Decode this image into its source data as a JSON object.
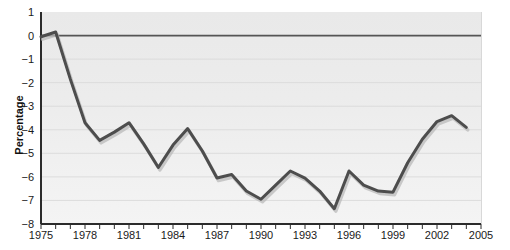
{
  "chart_data": {
    "type": "line",
    "title": "",
    "xlabel": "",
    "ylabel": "Percentage",
    "xlim": [
      1975,
      2005
    ],
    "ylim": [
      -8,
      1
    ],
    "grid": true,
    "legend": "none",
    "zero_line": 0,
    "series_color": "#4d4d4d",
    "plot_background": "#ececec",
    "gridline_color": "#dcdcdc",
    "y_ticks": [
      1,
      0,
      -1,
      -2,
      -3,
      -4,
      -5,
      -6,
      -7,
      -8
    ],
    "y_tick_labels": [
      "1",
      "0",
      "−1",
      "−2",
      "−3",
      "−4",
      "−5",
      "−6",
      "−7",
      "−8"
    ],
    "x_ticks": [
      1975,
      1976,
      1977,
      1978,
      1979,
      1980,
      1981,
      1982,
      1983,
      1984,
      1985,
      1986,
      1987,
      1988,
      1989,
      1990,
      1991,
      1992,
      1993,
      1994,
      1995,
      1996,
      1997,
      1998,
      1999,
      2000,
      2001,
      2002,
      2003,
      2004,
      2005
    ],
    "x_tick_labels": [
      "1975",
      "1978",
      "1981",
      "1984",
      "1987",
      "1990",
      "1993",
      "1996",
      "1999",
      "2002",
      "2005"
    ],
    "x_tick_label_values": [
      1975,
      1978,
      1981,
      1984,
      1987,
      1990,
      1993,
      1996,
      1999,
      2002,
      2005
    ],
    "x": [
      1975,
      1976,
      1977,
      1978,
      1979,
      1980,
      1981,
      1982,
      1983,
      1984,
      1985,
      1986,
      1987,
      1988,
      1989,
      1990,
      1991,
      1992,
      1993,
      1994,
      1995,
      1996,
      1997,
      1998,
      1999,
      2000,
      2001,
      2002,
      2003,
      2004
    ],
    "values": [
      -0.05,
      0.15,
      -1.85,
      -3.7,
      -4.45,
      -4.1,
      -3.7,
      -4.6,
      -5.6,
      -4.65,
      -3.95,
      -4.9,
      -6.05,
      -5.9,
      -6.6,
      -6.95,
      -6.35,
      -5.75,
      -6.05,
      -6.6,
      -7.35,
      -5.75,
      -6.35,
      -6.6,
      -6.65,
      -5.4,
      -4.4,
      -3.65,
      -3.4,
      -3.9
    ]
  }
}
